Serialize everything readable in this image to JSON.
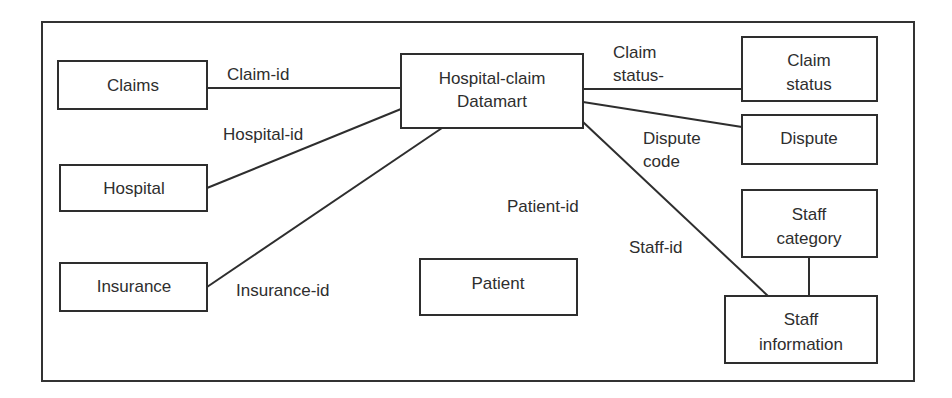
{
  "diagram": {
    "type": "entity-relationship",
    "entities": {
      "claims": {
        "label": [
          "Claims"
        ]
      },
      "hospital": {
        "label": [
          "Hospital"
        ]
      },
      "insurance": {
        "label": [
          "Insurance"
        ]
      },
      "datamart": {
        "label": [
          "Hospital-claim",
          "Datamart"
        ]
      },
      "claim_status": {
        "label": [
          "Claim",
          "status"
        ]
      },
      "dispute": {
        "label": [
          "Dispute"
        ]
      },
      "staff_category": {
        "label": [
          "Staff",
          "category"
        ]
      },
      "staff_information": {
        "label": [
          "Staff",
          "information"
        ]
      },
      "patient": {
        "label": [
          "Patient"
        ]
      }
    },
    "relationships": [
      {
        "from": "claims",
        "to": "datamart",
        "label": [
          "Claim-id"
        ]
      },
      {
        "from": "hospital",
        "to": "datamart",
        "label": [
          "Hospital-id"
        ]
      },
      {
        "from": "insurance",
        "to": "datamart",
        "label": [
          "Insurance-id"
        ]
      },
      {
        "from": "datamart",
        "to": "claim_status",
        "label": [
          "Claim",
          "status-"
        ]
      },
      {
        "from": "datamart",
        "to": "dispute",
        "label": [
          "Dispute",
          "code"
        ]
      },
      {
        "from": "datamart",
        "to": "staff_information",
        "label": [
          "Staff-id"
        ]
      },
      {
        "from": "staff_category",
        "to": "staff_information",
        "label": []
      },
      {
        "from": null,
        "to": "patient",
        "label": [
          "Patient-id"
        ]
      }
    ],
    "colors": {
      "stroke": "#2e2e2e",
      "background": "#ffffff"
    }
  }
}
